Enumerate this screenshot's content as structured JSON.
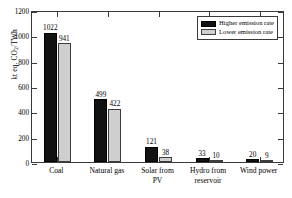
{
  "chart_data": {
    "type": "bar",
    "title": "",
    "xlabel": "",
    "ylabel": "kt eq. CO2/TWh",
    "ylabel_rich": {
      "prefix": "kt eq. CO",
      "sub": "2",
      "suffix": "/TWh"
    },
    "ylim": [
      0,
      1200
    ],
    "yticks": [
      0,
      200,
      400,
      600,
      800,
      1000,
      1200
    ],
    "ytick_labels": [
      "0",
      "200",
      "400",
      "600",
      "800",
      "1000",
      "1200"
    ],
    "grid": false,
    "legend_position": "top-right",
    "categories": [
      "Coal",
      "Natural gas",
      "Solar from\nPV",
      "Hydro from\nreservoir",
      "Wind power"
    ],
    "series": [
      {
        "name": "Higher emission rate",
        "color": "#121212",
        "values": [
          1022,
          499,
          121,
          33,
          20
        ],
        "labels": [
          "1022",
          "499",
          "121",
          "33",
          "20"
        ]
      },
      {
        "name": "Lower emission rate",
        "color": "#cfcfcf",
        "values": [
          941,
          422,
          38,
          10,
          9
        ],
        "labels": [
          "941",
          "422",
          "38",
          "10",
          "9"
        ]
      }
    ]
  },
  "legend": {
    "items": [
      {
        "label": "Higher emission rate"
      },
      {
        "label": "Lower emission rate"
      }
    ]
  }
}
